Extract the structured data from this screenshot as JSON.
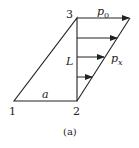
{
  "diagram": {
    "nodes": [
      {
        "id": "1",
        "label": "1"
      },
      {
        "id": "2",
        "label": "2"
      },
      {
        "id": "3",
        "label": "3"
      }
    ],
    "labels": {
      "p0": "p",
      "p0_sub": "0",
      "px": "p",
      "px_sub": "x",
      "L": "L",
      "a": "a"
    },
    "caption": "(a)",
    "line_color": "#222222"
  }
}
